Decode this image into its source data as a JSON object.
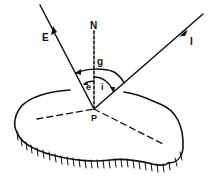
{
  "diagram": {
    "labels": {
      "normal": "N",
      "emission_ray": "E",
      "incidence_ray": "I",
      "phase_angle": "g",
      "emission_angle": "e",
      "incidence_angle": "i",
      "point": "P"
    },
    "colors": {
      "ink": "#111111",
      "background": "#ffffff"
    }
  }
}
